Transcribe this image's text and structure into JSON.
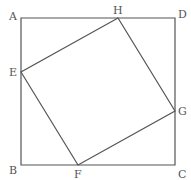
{
  "diagram": {
    "stroke_color": "#555555",
    "points": {
      "A": {
        "label": "A",
        "x": 21,
        "y": 18
      },
      "B": {
        "label": "B",
        "x": 21,
        "y": 165
      },
      "C": {
        "label": "C",
        "x": 175,
        "y": 165
      },
      "D": {
        "label": "D",
        "x": 175,
        "y": 18
      },
      "E": {
        "label": "E",
        "x": 21,
        "y": 72
      },
      "F": {
        "label": "F",
        "x": 78,
        "y": 165
      },
      "G": {
        "label": "G",
        "x": 175,
        "y": 111
      },
      "H": {
        "label": "H",
        "x": 118,
        "y": 18
      }
    },
    "outer_square": [
      "A",
      "B",
      "C",
      "D"
    ],
    "inner_square": [
      "E",
      "F",
      "G",
      "H"
    ]
  }
}
